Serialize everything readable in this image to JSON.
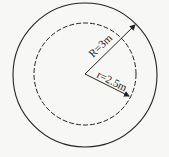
{
  "diagram": {
    "outer_circle": {
      "label": "R=3m",
      "style": "solid",
      "radius_value": "3m"
    },
    "inner_circle": {
      "label": "r=2.5m",
      "style": "dashed",
      "radius_value": "2.5m"
    },
    "labels": {
      "outer_radius": "R=3m",
      "inner_radius": "r=2.5m"
    },
    "colors": {
      "stroke": "#222222",
      "background": "#f7f7f5"
    }
  }
}
